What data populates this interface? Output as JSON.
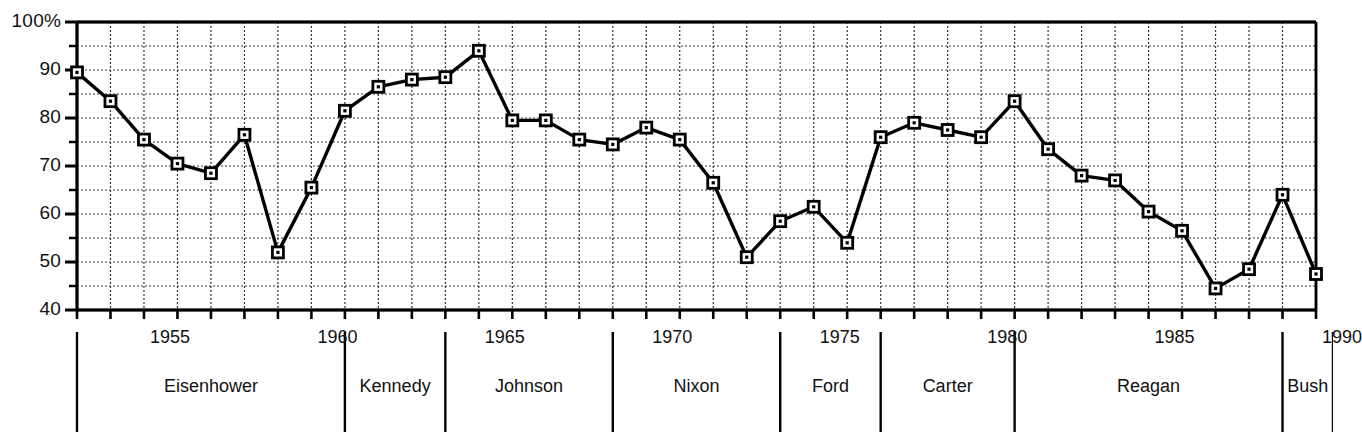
{
  "chart_data": {
    "type": "line",
    "title": "",
    "xlabel": "",
    "ylabel": "",
    "xlim": [
      1953,
      1990
    ],
    "ylim": [
      40,
      100
    ],
    "grid": true,
    "grid_step": 5,
    "legend": "none",
    "marker": "open-square",
    "x": [
      1953,
      1954,
      1955,
      1956,
      1957,
      1958,
      1959,
      1960,
      1961,
      1962,
      1963,
      1964,
      1965,
      1966,
      1967,
      1968,
      1969,
      1970,
      1971,
      1972,
      1973,
      1974,
      1975,
      1976,
      1977,
      1978,
      1979,
      1980,
      1981,
      1982,
      1983,
      1984,
      1985,
      1986,
      1987,
      1988,
      1989,
      1990
    ],
    "values": [
      89.5,
      83.5,
      75.5,
      70.5,
      68.5,
      76.5,
      52,
      65.5,
      81.5,
      86.5,
      88,
      88.5,
      94,
      79.5,
      79.5,
      75.5,
      74.5,
      78,
      75.5,
      66.5,
      51,
      58.5,
      61.5,
      54,
      76,
      79,
      77.5,
      76,
      83.5,
      73.5,
      68,
      67,
      60.5,
      56.5,
      44.5,
      48.5,
      64,
      47.5
    ],
    "ytick_values": [
      40,
      50,
      60,
      70,
      80,
      90,
      100
    ],
    "ytick_labels": [
      "40",
      "50",
      "60",
      "70",
      "80",
      "90",
      "100%"
    ],
    "xtick_values": [
      1955,
      1960,
      1965,
      1970,
      1975,
      1980,
      1985,
      1990
    ],
    "xtick_labels": [
      "1955",
      "1960",
      "1965",
      "1970",
      "1975",
      "1980",
      "1985",
      "1990"
    ],
    "administrations": [
      {
        "name": "Eisenhower",
        "start": 1953,
        "end": 1961
      },
      {
        "name": "Kennedy",
        "start": 1961,
        "end": 1964
      },
      {
        "name": "Johnson",
        "start": 1964,
        "end": 1969
      },
      {
        "name": "Nixon",
        "start": 1969,
        "end": 1974
      },
      {
        "name": "Ford",
        "start": 1974,
        "end": 1977
      },
      {
        "name": "Carter",
        "start": 1977,
        "end": 1981
      },
      {
        "name": "Reagan",
        "start": 1981,
        "end": 1989
      },
      {
        "name": "Bush",
        "start": 1989,
        "end": 1991
      }
    ]
  },
  "colors": {
    "line": "#000000",
    "grid": "#333333",
    "axis": "#000000",
    "background": "#ffffff"
  }
}
